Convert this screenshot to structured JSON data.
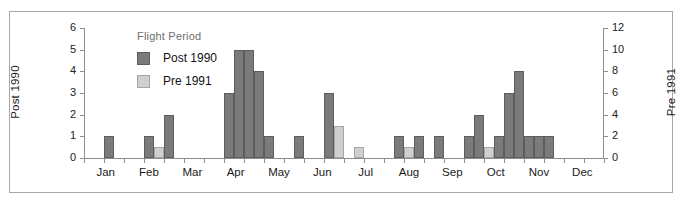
{
  "chart_data": {
    "type": "bar",
    "title": "",
    "legend_title": "Flight Period",
    "legend_position": "inside-top-left",
    "grid": false,
    "xlabel": "",
    "x_tick_labels": [
      "Jan",
      "Feb",
      "Mar",
      "Apr",
      "May",
      "Jun",
      "Jul",
      "Aug",
      "Sep",
      "Oct",
      "Nov",
      "Dec"
    ],
    "axes": [
      {
        "side": "left",
        "label": "Post 1990",
        "ylim": [
          0,
          6
        ],
        "ticks": [
          0,
          1,
          2,
          3,
          4,
          5,
          6
        ],
        "tick_labels": [
          "0",
          "1",
          "2",
          "3",
          "4",
          "5",
          "6"
        ]
      },
      {
        "side": "right",
        "label": "Pre 1991",
        "ylim": [
          0,
          12
        ],
        "ticks": [
          0,
          2,
          4,
          6,
          8,
          10,
          12
        ],
        "tick_labels": [
          "0",
          "2",
          "4",
          "6",
          "8",
          "10",
          "12"
        ]
      }
    ],
    "series": [
      {
        "name": "Post 1990",
        "axis": "left",
        "color": "#7b7b7b",
        "bars": [
          {
            "week": 2,
            "value": 1
          },
          {
            "week": 6,
            "value": 1
          },
          {
            "week": 8,
            "value": 2
          },
          {
            "week": 14,
            "value": 3
          },
          {
            "week": 15,
            "value": 5
          },
          {
            "week": 16,
            "value": 5
          },
          {
            "week": 17,
            "value": 4
          },
          {
            "week": 18,
            "value": 1
          },
          {
            "week": 21,
            "value": 1
          },
          {
            "week": 24,
            "value": 3
          },
          {
            "week": 31,
            "value": 1
          },
          {
            "week": 33,
            "value": 1
          },
          {
            "week": 35,
            "value": 1
          },
          {
            "week": 38,
            "value": 1
          },
          {
            "week": 39,
            "value": 2
          },
          {
            "week": 41,
            "value": 1
          },
          {
            "week": 42,
            "value": 3
          },
          {
            "week": 43,
            "value": 4
          },
          {
            "week": 44,
            "value": 1
          },
          {
            "week": 45,
            "value": 1
          },
          {
            "week": 46,
            "value": 1
          }
        ]
      },
      {
        "name": "Pre 1991",
        "axis": "right",
        "color": "#cfcfcf",
        "bars": [
          {
            "week": 7,
            "value": 1
          },
          {
            "week": 25,
            "value": 3
          },
          {
            "week": 27,
            "value": 1
          },
          {
            "week": 32,
            "value": 1
          },
          {
            "week": 40,
            "value": 1
          },
          {
            "week": 42,
            "value": 2
          },
          {
            "week": 43,
            "value": 1
          },
          {
            "week": 44,
            "value": 2
          },
          {
            "week": 45,
            "value": 2
          },
          {
            "week": 46,
            "value": 2
          }
        ]
      }
    ]
  }
}
